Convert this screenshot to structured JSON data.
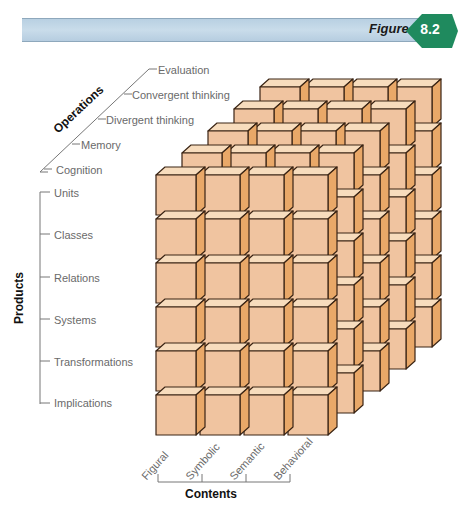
{
  "figure": {
    "word": "Figure",
    "number": "8.2",
    "badge_color": "#1f8a5e",
    "band_color": "#c2d7e7"
  },
  "operations": {
    "title": "Operations",
    "items": [
      "Evaluation",
      "Convergent thinking",
      "Divergent thinking",
      "Memory",
      "Cognition"
    ]
  },
  "products": {
    "title": "Products",
    "items": [
      "Units",
      "Classes",
      "Relations",
      "Systems",
      "Transformations",
      "Implications"
    ]
  },
  "contents": {
    "title": "Contents",
    "items": [
      "Figural",
      "Symbolic",
      "Semantic",
      "Behavioral"
    ]
  },
  "cube": {
    "columns": 4,
    "rows": 6,
    "layers": 5,
    "face_color": "#f0c4a0",
    "top_color": "#f7dcbd",
    "side_color": "#e9a868",
    "edge_color": "#3a2414"
  }
}
